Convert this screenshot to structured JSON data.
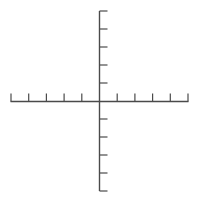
{
  "diagram": {
    "type": "coordinate-axes",
    "line_color": "#4a4a4a",
    "background": "#ffffff",
    "origin": {
      "x": 99.5,
      "y": 101.5
    },
    "x_axis": {
      "from": 10.5,
      "to": 188.5,
      "y": 101.5,
      "tick_direction": "up",
      "tick_length": 8,
      "ticks": [
        11,
        28.7,
        46.4,
        64.1,
        81.8,
        117.2,
        134.9,
        152.6,
        170.3,
        188
      ]
    },
    "y_axis": {
      "from": 11,
      "to": 191,
      "x": 99.5,
      "tick_direction": "right",
      "tick_length": 8,
      "ticks": [
        11,
        29,
        47,
        65,
        83,
        119,
        137,
        155,
        173,
        191
      ]
    }
  }
}
